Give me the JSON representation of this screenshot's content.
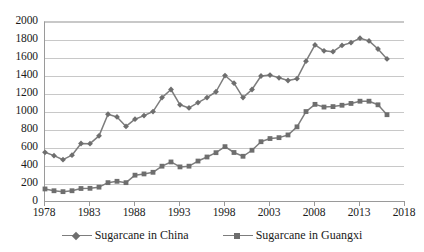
{
  "chart_data": {
    "type": "line",
    "title": "",
    "xlabel": "",
    "ylabel": "",
    "xlim": [
      1978,
      2018
    ],
    "ylim": [
      0,
      2000
    ],
    "ytick_step": 200,
    "xtick_step": 5,
    "grid": "horizontal",
    "legend_position": "bottom",
    "yticks": [
      "0",
      "200",
      "400",
      "600",
      "800",
      "1000",
      "1200",
      "1400",
      "1600",
      "1800",
      "2000"
    ],
    "xticks": [
      "1978",
      "1983",
      "1988",
      "1993",
      "1998",
      "2003",
      "2008",
      "2013",
      "2018"
    ],
    "x": [
      1978,
      1979,
      1980,
      1981,
      1982,
      1983,
      1984,
      1985,
      1986,
      1987,
      1988,
      1989,
      1990,
      1991,
      1992,
      1993,
      1994,
      1995,
      1996,
      1997,
      1998,
      1999,
      2000,
      2001,
      2002,
      2003,
      2004,
      2005,
      2006,
      2007,
      2008,
      2009,
      2010,
      2011,
      2012,
      2013,
      2014,
      2015,
      2016
    ],
    "series": [
      {
        "name": "Sugarcane in China",
        "marker": "diamond",
        "color": "#7d7d7d",
        "values": [
          552,
          515,
          470,
          520,
          650,
          648,
          735,
          975,
          945,
          840,
          920,
          960,
          1005,
          1160,
          1250,
          1080,
          1045,
          1105,
          1160,
          1225,
          1405,
          1320,
          1160,
          1250,
          1400,
          1410,
          1380,
          1350,
          1370,
          1565,
          1745,
          1680,
          1670,
          1740,
          1770,
          1820,
          1790,
          1700,
          1590
        ]
      },
      {
        "name": "Sugarcane in Guangxi",
        "marker": "square",
        "color": "#7d7d7d",
        "values": [
          145,
          125,
          115,
          125,
          150,
          152,
          165,
          215,
          230,
          215,
          298,
          312,
          330,
          398,
          445,
          390,
          398,
          455,
          500,
          548,
          615,
          550,
          508,
          575,
          670,
          705,
          715,
          745,
          835,
          1005,
          1085,
          1055,
          1060,
          1075,
          1095,
          1120,
          1120,
          1080,
          970
        ]
      }
    ]
  },
  "legend": {
    "items": [
      {
        "label": "Sugarcane in China",
        "marker": "diamond"
      },
      {
        "label": "Sugarcane in Guangxi",
        "marker": "square"
      }
    ]
  }
}
